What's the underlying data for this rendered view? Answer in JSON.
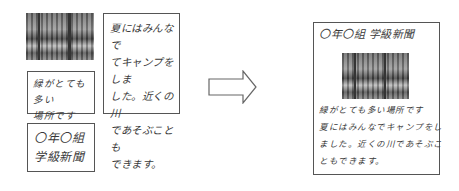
{
  "left": {
    "photo": {
      "icon": "forest-photo",
      "alt": "woodland photograph"
    },
    "text_box_tall": {
      "lines": [
        "夏にはみんなで",
        "てキャンプをしま",
        "した。近くの川",
        "であそぶことも",
        "できます。"
      ]
    },
    "text_box_small": {
      "lines": [
        "緑がとても多い",
        "場所です"
      ]
    },
    "title_box": {
      "lines": [
        "〇年〇組",
        "学級新聞"
      ]
    }
  },
  "arrow": {
    "icon": "right-arrow",
    "direction": "right"
  },
  "right": {
    "title": "〇年〇組 学級新聞",
    "photo": {
      "icon": "forest-photo",
      "alt": "woodland photograph"
    },
    "body_lines": [
      "緑がとても多い場所です",
      "夏にはみんなでキャンプをし",
      "ました。近くの川であそぶこ",
      "ともできます。"
    ]
  }
}
